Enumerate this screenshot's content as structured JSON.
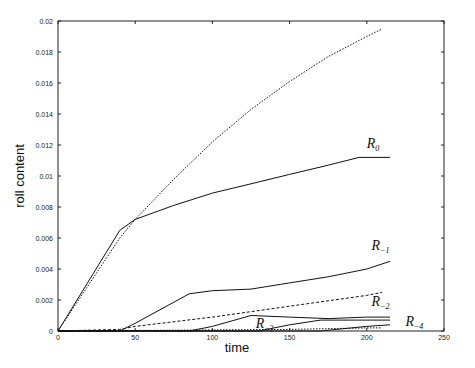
{
  "chart_data": {
    "type": "line",
    "title": "",
    "xlabel": "time",
    "ylabel": "roll content",
    "xlim": [
      0,
      250
    ],
    "ylim": [
      0,
      0.02
    ],
    "grid": false,
    "legend": "inline curve labels",
    "x_ticks": [
      0,
      50,
      100,
      150,
      200,
      250
    ],
    "x_tick_labels": [
      "0",
      "50",
      "100",
      "150",
      "200",
      "250"
    ],
    "y_ticks": [
      0,
      0.002,
      0.004,
      0.006,
      0.008,
      0.01,
      0.012,
      0.014,
      0.016,
      0.018,
      0.02
    ],
    "y_tick_labels": [
      "0",
      "0.002",
      "0.004",
      "0.006",
      "0.008",
      "0.01",
      "0.012",
      "0.014",
      "0.016",
      "0.018",
      "0.02"
    ],
    "series": [
      {
        "name": "R_0",
        "label_main": "R",
        "label_sub": "0",
        "style": "solid",
        "x": [
          0,
          40,
          50,
          75,
          100,
          125,
          150,
          175,
          195,
          215
        ],
        "values": [
          0,
          0.0065,
          0.0072,
          0.0081,
          0.0089,
          0.0095,
          0.0101,
          0.0107,
          0.0112,
          0.0112
        ],
        "label_pos": [
          200,
          0.0118
        ]
      },
      {
        "name": "R_0 (dotted)",
        "style": "dotted",
        "x": [
          0,
          40,
          50,
          75,
          100,
          125,
          150,
          175,
          200,
          210
        ],
        "values": [
          0,
          0.006,
          0.0072,
          0.0098,
          0.0122,
          0.0143,
          0.0161,
          0.0177,
          0.019,
          0.0195
        ]
      },
      {
        "name": "R_-1",
        "label_main": "R",
        "label_sub": "−1",
        "style": "solid",
        "x": [
          0,
          40,
          50,
          85,
          100,
          125,
          150,
          175,
          200,
          215
        ],
        "values": [
          0,
          0,
          0.0005,
          0.0024,
          0.0026,
          0.0027,
          0.0031,
          0.0035,
          0.004,
          0.0045
        ],
        "label_pos": [
          203,
          0.0052
        ]
      },
      {
        "name": "R_-1 (dashed)",
        "style": "dashed",
        "x": [
          0,
          40,
          50,
          100,
          150,
          200,
          210
        ],
        "values": [
          0,
          0.0001,
          0.0003,
          0.0009,
          0.0016,
          0.0023,
          0.0025
        ]
      },
      {
        "name": "R_-2",
        "label_main": "R",
        "label_sub": "−2",
        "style": "solid",
        "x": [
          0,
          85,
          100,
          125,
          150,
          175,
          200,
          215
        ],
        "values": [
          0,
          0,
          0.0003,
          0.001,
          0.0009,
          0.0008,
          0.0009,
          0.0009
        ],
        "label_pos": [
          203,
          0.0016
        ]
      },
      {
        "name": "R_-3",
        "label_main": "R",
        "label_sub": "−3",
        "style": "solid",
        "x": [
          0,
          130,
          150,
          170,
          200,
          215
        ],
        "values": [
          0,
          0,
          0.0004,
          0.0007,
          0.0007,
          0.0007
        ],
        "label_pos": [
          128,
          0.0002
        ]
      },
      {
        "name": "R_-4",
        "label_main": "R",
        "label_sub": "−4",
        "style": "solid",
        "x": [
          0,
          170,
          190,
          200,
          215
        ],
        "values": [
          0,
          0,
          0.0002,
          0.0003,
          0.0004
        ],
        "label_pos": [
          225,
          0.0003
        ]
      },
      {
        "name": "R_-2 (dotted)",
        "style": "dotted",
        "x": [
          0,
          150,
          200,
          210
        ],
        "values": [
          0,
          0.0001,
          0.0002,
          0.0002
        ]
      }
    ]
  }
}
